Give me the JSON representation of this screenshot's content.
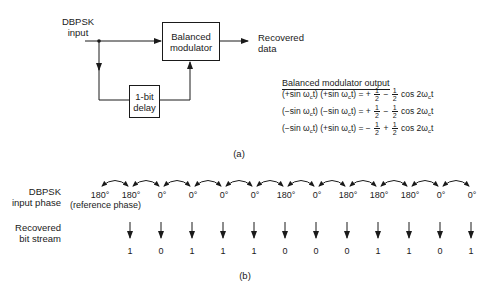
{
  "part_a": {
    "input_label_line1": "DBPSK",
    "input_label_line2": "input",
    "modulator_line1": "Balanced",
    "modulator_line2": "modulator",
    "delay_line1": "1-bit",
    "delay_line2": "delay",
    "output_label_line1": "Recovered",
    "output_label_line2": "data",
    "equations_title": "Balanced modulator output",
    "equations": [
      {
        "lhs": "(+sin ω",
        "lhs_sub": "c",
        "lhs2": "t) (+sin ω",
        "lhs2_sub": "c",
        "lhs3": "t) = +",
        "op": "−",
        "rhs": "cos 2ω",
        "rhs_sub": "c",
        "rhs_end": "t"
      },
      {
        "lhs": "(−sin ω",
        "lhs_sub": "c",
        "lhs2": "t) (−sin ω",
        "lhs2_sub": "c",
        "lhs3": "t) = +",
        "op": "−",
        "rhs": "cos 2ω",
        "rhs_sub": "c",
        "rhs_end": "t"
      },
      {
        "lhs": "(−sin ω",
        "lhs_sub": "c",
        "lhs2": "t) (+sin ω",
        "lhs2_sub": "c",
        "lhs3": "t) = −",
        "op": "+",
        "rhs": "cos 2ω",
        "rhs_sub": "c",
        "rhs_end": "t"
      }
    ],
    "frac_num": "1",
    "frac_den": "2",
    "caption": "(a)"
  },
  "part_b": {
    "phase_label_line1": "DBPSK",
    "phase_label_line2": "input phase",
    "reference_note": "(reference phase)",
    "phases": [
      "180°",
      "180°",
      "0°",
      "0°",
      "0°",
      "0°",
      "180°",
      "0°",
      "180°",
      "180°",
      "180°",
      "0°",
      "0°"
    ],
    "bits_label_line1": "Recovered",
    "bits_label_line2": "bit stream",
    "bits": [
      "1",
      "0",
      "1",
      "1",
      "1",
      "0",
      "0",
      "0",
      "1",
      "1",
      "0",
      "1"
    ],
    "caption": "(b)"
  }
}
